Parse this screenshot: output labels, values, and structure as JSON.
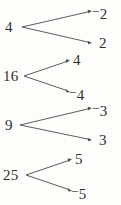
{
  "diagram": {
    "type": "square-root-mapping",
    "background_color": "#fdfdfc",
    "ink_color": "#2f2f2f",
    "arrow_color": "#4a4a4a",
    "groups": [
      {
        "id": "group-4",
        "source": "4",
        "source_x": 5,
        "source_y": 20,
        "vertex_x": 22,
        "vertex_y": 27,
        "targets": [
          {
            "id": "target-neg-2",
            "sign": "−",
            "value": "2",
            "label": "−2",
            "x": 97,
            "y": 4,
            "tip_x": 92,
            "tip_y": 11
          },
          {
            "id": "target-pos-2",
            "sign": "",
            "value": "2",
            "label": "2",
            "x": 99,
            "y": 36,
            "tip_x": 92,
            "tip_y": 43
          }
        ]
      },
      {
        "id": "group-16",
        "source": "16",
        "source_x": 3,
        "source_y": 69,
        "vertex_x": 24,
        "vertex_y": 76,
        "targets": [
          {
            "id": "target-pos-4",
            "sign": "",
            "value": "4",
            "label": "4",
            "x": 76,
            "y": 53,
            "tip_x": 70,
            "tip_y": 60
          },
          {
            "id": "target-neg-4",
            "sign": "−",
            "value": "4",
            "label": "−4",
            "x": 72,
            "y": 85,
            "tip_x": 70,
            "tip_y": 92
          }
        ]
      },
      {
        "id": "group-9",
        "source": "9",
        "source_x": 5,
        "source_y": 118,
        "vertex_x": 20,
        "vertex_y": 125,
        "targets": [
          {
            "id": "target-neg-3",
            "sign": "−",
            "value": "3",
            "label": "−3",
            "x": 97,
            "y": 101,
            "tip_x": 92,
            "tip_y": 108
          },
          {
            "id": "target-pos-3",
            "sign": "",
            "value": "3",
            "label": "3",
            "x": 99,
            "y": 133,
            "tip_x": 92,
            "tip_y": 140
          }
        ]
      },
      {
        "id": "group-25",
        "source": "25",
        "source_x": 3,
        "source_y": 168,
        "vertex_x": 26,
        "vertex_y": 175,
        "targets": [
          {
            "id": "target-pos-5",
            "sign": "",
            "value": "5",
            "label": "5",
            "x": 78,
            "y": 152,
            "tip_x": 72,
            "tip_y": 159
          },
          {
            "id": "target-neg-5",
            "sign": "−",
            "value": "5",
            "label": "−5",
            "x": 74,
            "y": 184,
            "tip_x": 72,
            "tip_y": 191
          }
        ]
      }
    ]
  }
}
